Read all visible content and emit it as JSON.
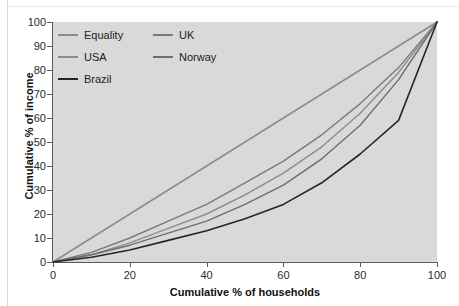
{
  "page": {
    "top_caption": ""
  },
  "legend": {
    "rows": [
      [
        {
          "label": "Equality",
          "color": "#8c8c8c",
          "key": "equality"
        },
        {
          "label": "UK",
          "color": "#7a7a7a",
          "key": "uk"
        }
      ],
      [
        {
          "label": "USA",
          "color": "#8c8c8c",
          "key": "usa"
        },
        {
          "label": "Norway",
          "color": "#6e6e6e",
          "key": "norway"
        }
      ],
      [
        {
          "label": "Brazil",
          "color": "#262626",
          "key": "brazil"
        }
      ]
    ]
  },
  "axes": {
    "y_ticks": [
      "100",
      "90",
      "80",
      "70",
      "60",
      "50",
      "40",
      "30",
      "20",
      "10",
      "0"
    ],
    "x_ticks": [
      "0",
      "20",
      "40",
      "60",
      "80",
      "100"
    ]
  },
  "chart_data": {
    "type": "line",
    "title": "",
    "xlabel": "Cumulative % of households",
    "ylabel": "Cumulative % of income",
    "xlim": [
      0,
      100
    ],
    "ylim": [
      0,
      100
    ],
    "x_ticks": [
      0,
      20,
      40,
      60,
      80,
      100
    ],
    "y_ticks": [
      0,
      10,
      20,
      30,
      40,
      50,
      60,
      70,
      80,
      90,
      100
    ],
    "grid": false,
    "legend_position": "top-left",
    "x": [
      0,
      10,
      20,
      30,
      40,
      50,
      60,
      70,
      80,
      90,
      100
    ],
    "series": [
      {
        "name": "Equality",
        "color": "#8c8c8c",
        "width": 1.6,
        "values": [
          0,
          10,
          20,
          30,
          40,
          50,
          60,
          70,
          80,
          90,
          100
        ]
      },
      {
        "name": "UK",
        "color": "#7a7a7a",
        "width": 1.4,
        "values": [
          0,
          4,
          10,
          17,
          24,
          33,
          42,
          53,
          66,
          81,
          100
        ]
      },
      {
        "name": "USA",
        "color": "#8c8c8c",
        "width": 1.4,
        "values": [
          0,
          3,
          8,
          14,
          20,
          28,
          37,
          48,
          62,
          79,
          100
        ]
      },
      {
        "name": "Norway",
        "color": "#6e6e6e",
        "width": 1.4,
        "values": [
          0,
          3,
          7,
          12,
          17,
          24,
          32,
          43,
          57,
          76,
          100
        ]
      },
      {
        "name": "Brazil",
        "color": "#262626",
        "width": 1.6,
        "values": [
          0,
          2,
          5,
          9,
          13,
          18,
          24,
          33,
          45,
          59,
          100
        ]
      }
    ]
  }
}
